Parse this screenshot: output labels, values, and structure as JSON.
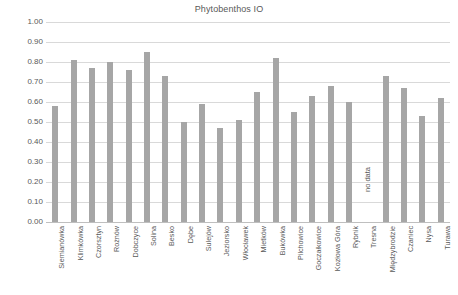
{
  "chart_data": {
    "type": "bar",
    "title": "Phytobenthos IO",
    "xlabel": "",
    "ylabel": "",
    "ylim": [
      0.0,
      1.0
    ],
    "ytick_labels": [
      "1.00",
      "0.90",
      "0.80",
      "0.70",
      "0.60",
      "0.50",
      "0.40",
      "0.30",
      "0.20",
      "0.10",
      "0.00"
    ],
    "ytick_values": [
      1.0,
      0.9,
      0.8,
      0.7,
      0.6,
      0.5,
      0.4,
      0.3,
      0.2,
      0.1,
      0.0
    ],
    "grid": true,
    "legend": "none",
    "bar_color": "#a6a6a6",
    "categories": [
      "Siemianówka",
      "Klimkówka",
      "Czorsztyn",
      "Rożnów",
      "Dobczyce",
      "Solina",
      "Besko",
      "Dębe",
      "Sulejów",
      "Jeziorsko",
      "Włocławek",
      "Mietków",
      "Bukówka",
      "Pilchowice",
      "Goczałkowice",
      "Kozłowa Góra",
      "Rybnik",
      "Tresna",
      "Międzybrodzie",
      "Czaniec",
      "Nysa",
      "Turawa"
    ],
    "values": [
      0.58,
      0.81,
      0.77,
      0.8,
      0.76,
      0.85,
      0.73,
      0.5,
      0.59,
      0.47,
      0.51,
      0.65,
      0.82,
      0.55,
      0.63,
      0.68,
      0.6,
      null,
      0.73,
      0.67,
      0.53,
      0.62
    ],
    "annotations": [
      {
        "category": "Tresna",
        "text": "no data",
        "rotation": -90
      }
    ]
  }
}
